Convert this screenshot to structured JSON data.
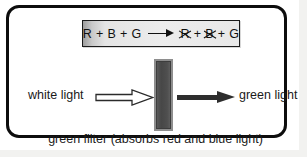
{
  "figure": {
    "caption": "green filter (absorbs red and blue light)",
    "equation": {
      "left": [
        {
          "symbol": "R",
          "struck": false
        },
        {
          "symbol": "+",
          "struck": false
        },
        {
          "symbol": "B",
          "struck": false
        },
        {
          "symbol": "+",
          "struck": false
        },
        {
          "symbol": "G",
          "struck": false
        }
      ],
      "arrow": "right-arrow-icon",
      "right": [
        {
          "symbol": "R",
          "struck": true
        },
        {
          "symbol": "+",
          "struck": false
        },
        {
          "symbol": "B",
          "struck": true
        },
        {
          "symbol": "+",
          "struck": false
        },
        {
          "symbol": "G",
          "struck": false
        }
      ],
      "left_text": "R + B + G",
      "right_text": "R + B + G"
    },
    "beam": {
      "input_label": "white light",
      "output_label": "green light",
      "input_arrow": "hollow-right-arrow-icon",
      "output_arrow": "solid-right-arrow-icon",
      "filter_name": "green-filter-bar"
    },
    "colors": {
      "frame_border": "#0d0d0d",
      "page_background": "#ffffff",
      "backdrop": "#f2f2f0",
      "equation_box_fill": "#ececec",
      "equation_box_border": "#1a1a1a",
      "filter_fill": "#474747",
      "filter_border": "#8e8e8e",
      "arrow_solid": "#2e2e2e",
      "text": "#1a1a1a"
    }
  }
}
